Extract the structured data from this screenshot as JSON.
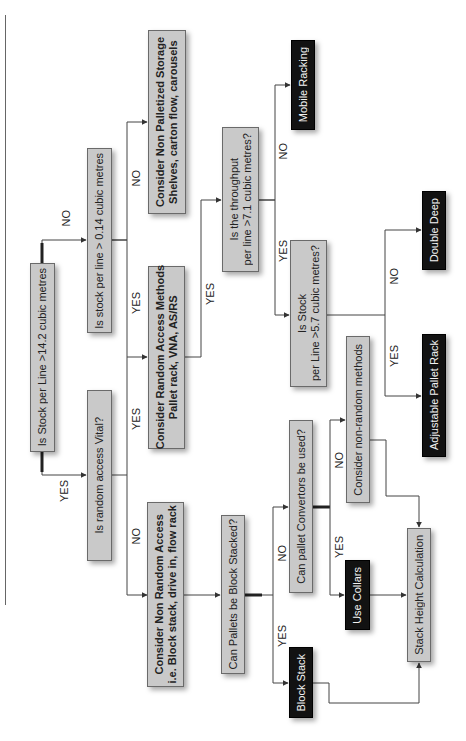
{
  "diagram": {
    "type": "flowchart",
    "orientation": "rotated-90-ccw",
    "colors": {
      "question_box": "#c9c9c9",
      "terminal_box": "#121212",
      "terminal_text": "#f2f2f2",
      "line": "#444444"
    },
    "nodes": {
      "q_stock_14_2": {
        "text": "Is Stock per Line >14.2 cubic metres"
      },
      "q_stock_0_14": {
        "text": "Is stock per line > 0.14 cubic metres"
      },
      "q_random_vital": {
        "text": "Is random access Vital?"
      },
      "non_palletized": {
        "line1": "Consider Non Palletized Storage",
        "line2": "Shelves, carton flow, carousels"
      },
      "random_access": {
        "line1": "Consider Random Access Methods",
        "line2": "Pallet rack, VNA, AS/RS"
      },
      "non_random_access": {
        "line1": "Consider Non Random Access",
        "line2": "i.e. Block stack, drive in, flow rack"
      },
      "q_block_stacked": {
        "text": "Can Pallets be Block Stacked?"
      },
      "q_throughput": {
        "line1": "Is the throughput",
        "line2": "per line >7.1 cubic metres?"
      },
      "mobile_racking": {
        "text": "Mobile Racking"
      },
      "q_stock_5_7": {
        "line1": "Is Stock",
        "line2": "per Line >5.7 cubic metres?"
      },
      "double_deep": {
        "text": "Double Deep"
      },
      "adjustable_pallet_rack": {
        "text": "Adjustable Pallet Rack"
      },
      "q_convertors": {
        "text": "Can pallet Convertors be used?"
      },
      "non_random_methods": {
        "text": "Consider non-random methods"
      },
      "use_collars": {
        "text": "Use Collars"
      },
      "block_stack": {
        "text": "Block Stack"
      },
      "stack_height_calc": {
        "text": "Stack Height Calculation"
      }
    },
    "edge_labels": {
      "q1_no": "NO",
      "q1_yes": "YES",
      "q2_no": "NO",
      "q2_yes": "YES",
      "q3_yes": "YES",
      "q3_no": "NO",
      "ra_yes": "YES",
      "tp_no": "NO",
      "tp_yes": "YES",
      "s57_no": "NO",
      "s57_yes": "YES",
      "bs_no": "NO",
      "bs_yes": "YES",
      "conv_no": "NO",
      "conv_yes": "YES"
    },
    "edges": [
      {
        "from": "q_stock_14_2",
        "to": "q_stock_0_14",
        "label": "NO"
      },
      {
        "from": "q_stock_14_2",
        "to": "q_random_vital",
        "label": "YES"
      },
      {
        "from": "q_stock_0_14",
        "to": "non_palletized",
        "label": "NO"
      },
      {
        "from": "q_stock_0_14",
        "to": "random_access",
        "label": "YES"
      },
      {
        "from": "q_random_vital",
        "to": "random_access",
        "label": "YES"
      },
      {
        "from": "q_random_vital",
        "to": "non_random_access",
        "label": "NO"
      },
      {
        "from": "random_access",
        "to": "q_throughput",
        "label": "YES"
      },
      {
        "from": "q_throughput",
        "to": "mobile_racking",
        "label": "NO"
      },
      {
        "from": "q_throughput",
        "to": "q_stock_5_7",
        "label": "YES"
      },
      {
        "from": "q_stock_5_7",
        "to": "double_deep",
        "label": "NO"
      },
      {
        "from": "q_stock_5_7",
        "to": "adjustable_pallet_rack",
        "label": "YES"
      },
      {
        "from": "non_random_access",
        "to": "q_block_stacked",
        "label": ""
      },
      {
        "from": "q_block_stacked",
        "to": "q_convertors",
        "label": "NO"
      },
      {
        "from": "q_block_stacked",
        "to": "block_stack",
        "label": "YES"
      },
      {
        "from": "q_convertors",
        "to": "non_random_methods",
        "label": "NO"
      },
      {
        "from": "q_convertors",
        "to": "use_collars",
        "label": "YES"
      },
      {
        "from": "non_random_methods",
        "to": "stack_height_calc",
        "label": ""
      },
      {
        "from": "use_collars",
        "to": "stack_height_calc",
        "label": ""
      },
      {
        "from": "block_stack",
        "to": "stack_height_calc",
        "label": ""
      }
    ]
  }
}
